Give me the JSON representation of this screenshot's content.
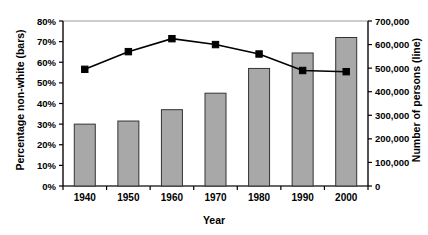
{
  "chart_data": {
    "type": "bar",
    "title": "",
    "xlabel": "Year",
    "ylabel": "Percentage non-white (bars)",
    "ylabel_right": "Number of persons (line)",
    "categories": [
      "1940",
      "1950",
      "1960",
      "1970",
      "1980",
      "1990",
      "2000"
    ],
    "ylim": [
      0,
      0.8
    ],
    "ylim_right": [
      0,
      700000
    ],
    "grid": false,
    "legend": "none",
    "series": [
      {
        "name": "Percentage non-white (bars)",
        "type": "bar",
        "axis": "left",
        "values": [
          0.3,
          0.315,
          0.37,
          0.45,
          0.57,
          0.645,
          0.72
        ],
        "color": "#a8a8a8",
        "border_color": "#333333"
      },
      {
        "name": "Number of persons (line)",
        "type": "line",
        "axis": "right",
        "values": [
          495000,
          570000,
          625000,
          600000,
          560000,
          490000,
          485000
        ],
        "color": "#000000",
        "marker": "square"
      }
    ],
    "yticks_left": [
      "0%",
      "10%",
      "20%",
      "30%",
      "40%",
      "50%",
      "60%",
      "70%",
      "80%"
    ],
    "ytick_values_left": [
      0,
      0.1,
      0.2,
      0.3,
      0.4,
      0.5,
      0.6,
      0.7,
      0.8
    ],
    "yticks_right": [
      "0",
      "100,000",
      "200,000",
      "300,000",
      "400,000",
      "500,000",
      "600,000",
      "700,000"
    ],
    "ytick_values_right": [
      0,
      100000,
      200000,
      300000,
      400000,
      500000,
      600000,
      700000
    ]
  },
  "axes": {
    "x_title": "Year",
    "y_left_title": "Percentage non-white (bars)",
    "y_right_title": "Number of persons (line)"
  }
}
